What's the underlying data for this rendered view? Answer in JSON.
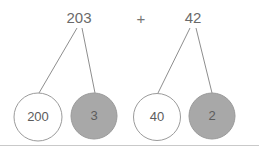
{
  "diagram": {
    "type": "number-bond-decomposition",
    "expression": "203 + 42",
    "operator": "+",
    "colors": {
      "filled_circle": "#a8a8a8",
      "open_circle": "#ffffff",
      "stroke": "#9b9b9b",
      "line": "#8e8e8e",
      "text": "#5c5c5c",
      "background": "#ffffff"
    },
    "groups": [
      {
        "id": "addend-1",
        "total": "203",
        "total_pos": {
          "x": 79,
          "y": 18
        },
        "parts": [
          {
            "id": "part-200",
            "label": "200",
            "fill": "open",
            "cx": 38,
            "cy": 117,
            "r": 24
          },
          {
            "id": "part-3",
            "label": "3",
            "fill": "shaded",
            "cx": 94,
            "cy": 116,
            "r": 23
          }
        ]
      },
      {
        "id": "addend-2",
        "total": "42",
        "total_pos": {
          "x": 193,
          "y": 18
        },
        "parts": [
          {
            "id": "part-40",
            "label": "40",
            "fill": "open",
            "cx": 157,
            "cy": 117,
            "r": 23.5
          },
          {
            "id": "part-2",
            "label": "2",
            "fill": "shaded",
            "cx": 212,
            "cy": 116,
            "r": 23
          }
        ]
      }
    ],
    "operator_pos": {
      "x": 141,
      "y": 20
    }
  }
}
